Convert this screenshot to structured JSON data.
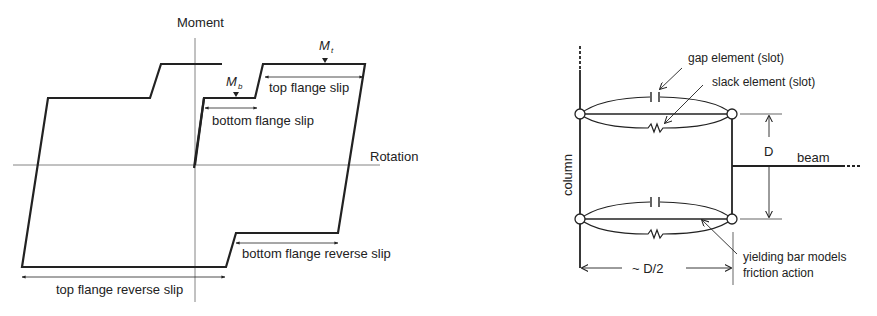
{
  "left_diagram": {
    "title": "Hysteretic moment-rotation behavior with flange slip",
    "axes": {
      "y_label": "Moment",
      "x_label": "Rotation"
    },
    "symbols": {
      "M_t": {
        "base": "M",
        "sub": "t"
      },
      "M_b": {
        "base": "M",
        "sub": "b"
      }
    },
    "annotations": {
      "top_flange_slip": "top flange slip",
      "bottom_flange_slip": "bottom flange slip",
      "bottom_flange_reverse_slip": "bottom flange reverse slip",
      "top_flange_reverse_slip": "top flange reverse slip"
    }
  },
  "right_diagram": {
    "title": "Connection model with gap, slack and yielding bar elements",
    "labels": {
      "gap_element": "gap element (slot)",
      "slack_element": "slack element (slot)",
      "column": "column",
      "beam": "beam",
      "depth": "D",
      "width": "~ D/2",
      "yielding_bar_line1": "yielding bar models",
      "yielding_bar_line2": "friction action"
    }
  },
  "colors": {
    "line": "#222222",
    "axis": "#777777",
    "background": "#ffffff"
  }
}
